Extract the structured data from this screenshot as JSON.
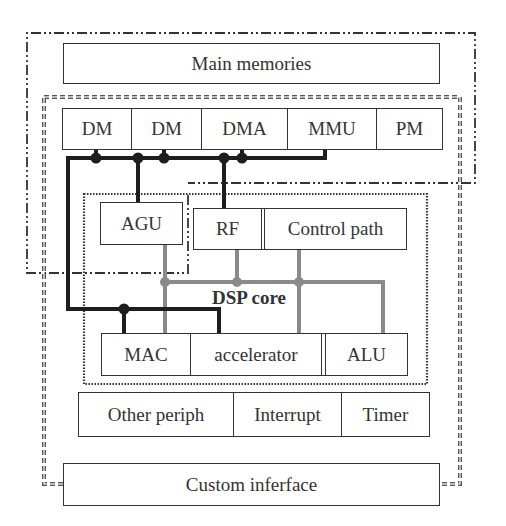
{
  "diagram": {
    "main_memories": "Main memories",
    "memory_row": [
      "DM",
      "DM",
      "DMA",
      "MMU",
      "PM"
    ],
    "dsp_core_label": "DSP core",
    "core_top": {
      "agu": "AGU",
      "rf": "RF",
      "control": "Control path"
    },
    "core_bottom": [
      "MAC",
      "accelerator",
      "ALU"
    ],
    "peripherals": [
      "Other periph",
      "Interrupt",
      "Timer"
    ],
    "custom_interface": "Custom inferface",
    "colors": {
      "black_bus": "#1e1e1e",
      "gray_bus": "#8a8a8a",
      "box_border": "#333333"
    }
  }
}
